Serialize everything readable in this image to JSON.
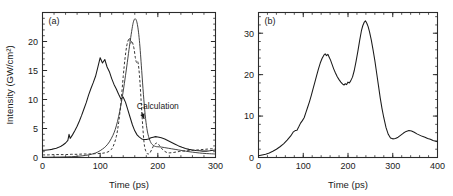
{
  "figure": {
    "background": "#ffffff",
    "ink_color": "#1a1a1a"
  },
  "chart_data": [
    {
      "type": "line",
      "panel_label": "(a)",
      "title": "",
      "xlabel": "Time (ps)",
      "ylabel": "Intensity (GW/cm²)",
      "xlim": [
        0,
        300
      ],
      "ylim": [
        0,
        25
      ],
      "xticks": [
        0,
        100,
        200,
        300
      ],
      "xticklabels": [
        "0",
        "100",
        "200",
        "300"
      ],
      "yticks": [
        0,
        5,
        10,
        15,
        20
      ],
      "yticklabels": [
        "0",
        "5",
        "10",
        "15",
        "20"
      ],
      "x_minor_step": 20,
      "y_minor_step": 1,
      "grid": false,
      "legend": "none",
      "annotations": [
        {
          "text": "Calculation",
          "x": 200,
          "y": 8.4,
          "arrow_to_x": 172,
          "arrow_to_y": 6.2
        }
      ],
      "series": [
        {
          "name": "experiment-noisy",
          "style": "solid-noisy",
          "x": [
            0,
            4,
            8,
            12,
            16,
            20,
            24,
            28,
            32,
            36,
            40,
            44,
            46,
            48,
            52,
            56,
            60,
            64,
            68,
            72,
            76,
            80,
            84,
            88,
            92,
            96,
            100,
            104,
            108,
            112,
            116,
            120,
            124,
            128,
            132,
            136,
            140,
            144,
            148,
            152,
            156,
            160,
            164,
            168,
            172,
            176,
            180,
            184,
            188,
            192,
            196,
            200,
            206,
            212,
            218,
            224,
            230,
            236,
            242,
            248,
            254,
            260,
            266,
            272,
            278,
            284,
            290,
            296,
            300
          ],
          "y": [
            1.25,
            1.25,
            1.3,
            1.35,
            1.4,
            1.5,
            1.6,
            1.75,
            1.95,
            2.2,
            2.5,
            2.95,
            4.0,
            3.3,
            3.9,
            4.6,
            5.4,
            6.3,
            7.3,
            8.4,
            9.5,
            10.8,
            11.9,
            12.9,
            14.0,
            15.6,
            17.2,
            16.3,
            16.9,
            15.6,
            14.8,
            13.6,
            12.6,
            11.8,
            10.9,
            10.1,
            10.4,
            9.5,
            8.2,
            6.9,
            5.6,
            4.6,
            3.9,
            3.5,
            3.2,
            3.1,
            3.1,
            3.2,
            3.4,
            3.5,
            3.6,
            3.55,
            3.4,
            3.2,
            2.9,
            2.6,
            2.3,
            2.0,
            1.75,
            1.55,
            1.4,
            1.3,
            1.2,
            1.15,
            1.1,
            1.1,
            1.15,
            1.25,
            1.3
          ]
        },
        {
          "name": "experiment-dashed",
          "style": "dashed",
          "x": [
            0,
            10,
            20,
            30,
            40,
            50,
            60,
            70,
            80,
            90,
            100,
            108,
            116,
            122,
            128,
            132,
            136,
            140,
            143,
            146,
            149,
            151,
            153,
            155,
            157,
            159,
            161,
            163,
            165,
            167,
            169,
            171,
            173,
            175,
            177,
            180,
            183,
            186,
            189,
            192,
            195,
            198,
            201,
            204,
            208,
            212,
            216,
            220,
            226,
            232,
            238,
            244,
            250,
            256,
            262,
            268,
            274,
            280,
            286,
            292,
            296,
            300
          ],
          "y": [
            0.45,
            0.45,
            0.5,
            0.5,
            0.5,
            0.55,
            0.55,
            0.6,
            0.6,
            0.65,
            0.7,
            0.8,
            1.1,
            1.8,
            3.6,
            6.0,
            9.4,
            14.0,
            17.0,
            19.2,
            20.3,
            20.6,
            19.7,
            20.1,
            19.5,
            18.6,
            17.2,
            16.4,
            16.6,
            15.4,
            13.0,
            9.8,
            6.6,
            3.8,
            1.9,
            0.9,
            0.6,
            0.75,
            1.3,
            1.9,
            2.3,
            2.5,
            2.3,
            1.9,
            1.4,
            1.05,
            0.85,
            0.8,
            0.85,
            0.95,
            1.05,
            1.1,
            1.15,
            1.2,
            1.25,
            1.3,
            1.35,
            1.4,
            1.45,
            1.5,
            1.5,
            1.5
          ]
        },
        {
          "name": "calculation",
          "style": "solid-thin",
          "x": [
            0,
            10,
            20,
            30,
            40,
            50,
            60,
            70,
            80,
            88,
            96,
            104,
            110,
            116,
            122,
            126,
            130,
            134,
            138,
            142,
            146,
            150,
            153,
            156,
            158,
            160,
            162,
            164,
            166,
            168,
            170,
            172,
            175,
            178,
            181,
            184,
            188,
            192,
            196,
            200,
            206,
            212,
            218,
            224,
            230,
            236,
            242,
            248,
            254,
            260,
            266,
            272,
            278,
            284,
            290,
            296,
            300
          ],
          "y": [
            0.05,
            0.05,
            0.06,
            0.08,
            0.1,
            0.14,
            0.2,
            0.3,
            0.45,
            0.65,
            0.95,
            1.45,
            1.95,
            2.7,
            3.8,
            4.8,
            6.2,
            8.0,
            10.2,
            12.8,
            15.6,
            18.6,
            20.7,
            22.6,
            23.5,
            23.9,
            23.8,
            23.2,
            22.0,
            20.2,
            17.8,
            15.0,
            10.9,
            7.4,
            5.0,
            3.6,
            2.55,
            2.1,
            1.9,
            1.85,
            1.8,
            1.7,
            1.6,
            1.5,
            1.4,
            1.3,
            1.2,
            1.1,
            1.0,
            0.92,
            0.85,
            0.78,
            0.72,
            0.68,
            0.65,
            0.62,
            0.6
          ]
        }
      ]
    },
    {
      "type": "line",
      "panel_label": "(b)",
      "title": "",
      "xlabel": "Time (ps)",
      "ylabel": "",
      "xlim": [
        0,
        400
      ],
      "ylim": [
        0,
        35
      ],
      "xticks": [
        0,
        100,
        200,
        300,
        400
      ],
      "xticklabels": [
        "0",
        "100",
        "200",
        "300",
        "400"
      ],
      "yticks": [
        0,
        10,
        20,
        30
      ],
      "yticklabels": [
        "0",
        "10",
        "20",
        "30"
      ],
      "x_minor_step": 20,
      "y_minor_step": 2,
      "grid": false,
      "legend": "none",
      "annotations": [],
      "series": [
        {
          "name": "measured-intensity",
          "style": "solid-noisy",
          "x": [
            0,
            8,
            16,
            24,
            32,
            40,
            48,
            56,
            64,
            72,
            78,
            82,
            86,
            90,
            94,
            98,
            102,
            106,
            110,
            114,
            118,
            122,
            126,
            130,
            134,
            138,
            142,
            146,
            149,
            152,
            155,
            158,
            161,
            164,
            168,
            172,
            176,
            180,
            184,
            188,
            191,
            194,
            197,
            200,
            203,
            206,
            210,
            214,
            218,
            222,
            226,
            230,
            233,
            236,
            239,
            242,
            245,
            248,
            252,
            256,
            260,
            264,
            268,
            272,
            276,
            280,
            285,
            290,
            295,
            300,
            306,
            312,
            318,
            324,
            330,
            336,
            342,
            348,
            354,
            360,
            366,
            372,
            378,
            384,
            390,
            396,
            400
          ],
          "y": [
            0.4,
            0.6,
            0.8,
            1.1,
            1.5,
            2.0,
            2.6,
            3.3,
            4.2,
            5.2,
            6.2,
            6.5,
            6.6,
            7.4,
            8.3,
            8.9,
            9.6,
            10.9,
            12.2,
            13.5,
            15.0,
            16.6,
            18.2,
            19.8,
            21.4,
            22.8,
            23.9,
            24.7,
            25.0,
            24.6,
            24.9,
            24.2,
            23.5,
            22.6,
            21.4,
            20.4,
            19.5,
            18.8,
            18.2,
            17.7,
            17.5,
            17.8,
            17.6,
            18.2,
            18.0,
            18.5,
            19.4,
            21.0,
            23.2,
            25.6,
            28.2,
            30.6,
            31.8,
            32.6,
            33.0,
            32.4,
            31.6,
            30.4,
            28.4,
            26.0,
            23.4,
            20.4,
            17.4,
            14.4,
            11.8,
            9.6,
            7.2,
            5.6,
            4.7,
            4.5,
            4.6,
            4.9,
            5.4,
            5.9,
            6.3,
            6.5,
            6.4,
            6.1,
            5.7,
            5.4,
            5.1,
            4.9,
            4.6,
            4.4,
            4.1,
            3.9,
            3.8
          ]
        }
      ]
    }
  ]
}
